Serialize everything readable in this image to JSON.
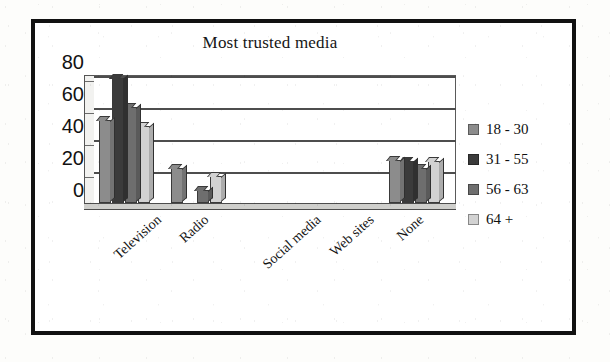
{
  "chart_data": {
    "type": "bar",
    "title": "Most trusted media",
    "xlabel": "",
    "ylabel": "",
    "ylim": [
      0,
      80
    ],
    "yticks": [
      0,
      20,
      40,
      60,
      80
    ],
    "grid": true,
    "legend_position": "right",
    "categories": [
      "Television",
      "Radio",
      "Social media",
      "Web sites",
      "None"
    ],
    "series": [
      {
        "name": "18 - 30",
        "color": "#8c8c8c",
        "values": [
          52,
          22,
          0,
          0,
          27
        ]
      },
      {
        "name": "31 - 55",
        "color": "#3b3b3b",
        "values": [
          78,
          0,
          0,
          0,
          26
        ]
      },
      {
        "name": "56 - 63",
        "color": "#6e6e6e",
        "values": [
          60,
          8,
          0,
          0,
          22
        ]
      },
      {
        "name": "64 +",
        "color": "#d2d2d2",
        "values": [
          48,
          17,
          0,
          0,
          26
        ]
      }
    ]
  },
  "axis": {
    "yticks": [
      {
        "label": "80"
      },
      {
        "label": "60"
      },
      {
        "label": "40"
      },
      {
        "label": "20"
      },
      {
        "label": "0"
      }
    ]
  },
  "legend": {
    "items": [
      {
        "label": "18 - 30",
        "color": "#8c8c8c"
      },
      {
        "label": "31 - 55",
        "color": "#3b3b3b"
      },
      {
        "label": "56 - 63",
        "color": "#6e6e6e"
      },
      {
        "label": "64 +",
        "color": "#d2d2d2"
      }
    ]
  },
  "colors": {
    "frame": "#111111",
    "background": "#ffffff",
    "gridline": "#4d4d4d",
    "text": "#121212"
  }
}
